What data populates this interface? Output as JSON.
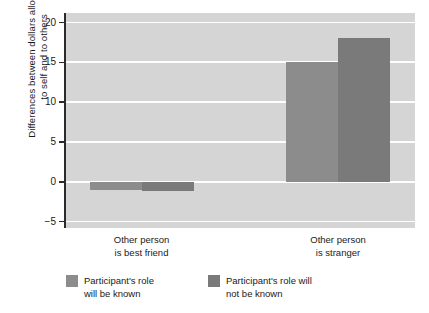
{
  "chart_data": {
    "type": "bar",
    "title": "",
    "xlabel": "",
    "ylabel": "Differences between dollars allocated\nto self and to others",
    "ylim": [
      -5.8,
      21.2
    ],
    "yticks": [
      -5,
      0,
      5,
      10,
      15,
      20
    ],
    "ytick_labels": [
      "−5",
      "0",
      "5",
      "10",
      "15",
      "20"
    ],
    "grid": true,
    "grid_color": "#ffffff",
    "plot_background": "#d5d5d5",
    "legend_position": "below",
    "categories": [
      "Other person\nis best friend",
      "Other person\nis stranger"
    ],
    "series": [
      {
        "name": "Participant's role\nwill be known",
        "legend_label": "Participant's role\nwill be known",
        "color": "#8c8c8c",
        "values": [
          -1,
          15
        ]
      },
      {
        "name": "Participant's role will\nnot be known",
        "legend_label": "Participant's role will\nnot be known",
        "color": "#7a7a7a",
        "values": [
          -1.2,
          18
        ]
      }
    ]
  },
  "axis": {
    "y_title": "Differences between dollars allocated\nto self and to others",
    "tick_0": "20",
    "tick_1": "15",
    "tick_2": "10",
    "tick_3": "5",
    "tick_4": "0",
    "tick_5": "−5"
  },
  "categories": {
    "cat_0": "Other person\nis best friend",
    "cat_1": "Other person\nis stranger"
  },
  "legend": {
    "item_0_label": "Participant's role\nwill be known",
    "item_1_label": "Participant's role will\nnot be known",
    "item_0_color": "#8c8c8c",
    "item_1_color": "#7a7a7a"
  }
}
